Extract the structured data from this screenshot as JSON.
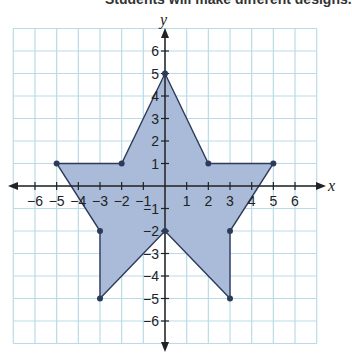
{
  "caption": "Students will make different designs.",
  "chart_data": {
    "type": "scatter",
    "xlabel": "x",
    "ylabel": "y",
    "xlim": [
      -7,
      7
    ],
    "ylim": [
      -7,
      7
    ],
    "grid": true,
    "x_ticks": [
      -6,
      -5,
      -4,
      -3,
      -2,
      -1,
      1,
      2,
      3,
      4,
      5,
      6
    ],
    "y_ticks": [
      -6,
      -5,
      -4,
      -3,
      -2,
      -1,
      1,
      2,
      3,
      4,
      5,
      6
    ],
    "polygon": [
      [
        0,
        5
      ],
      [
        2,
        1
      ],
      [
        5,
        1
      ],
      [
        3,
        -2
      ],
      [
        3,
        -5
      ],
      [
        0,
        -2
      ],
      [
        -3,
        -5
      ],
      [
        -3,
        -2
      ],
      [
        -5,
        1
      ],
      [
        -2,
        1
      ]
    ],
    "fill_color": "#a9bbd9",
    "stroke_color": "#2c3b5a",
    "grid_color": "#b9dbe8"
  }
}
